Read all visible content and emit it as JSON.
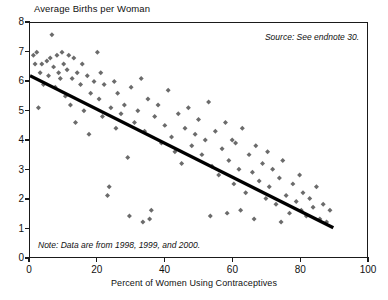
{
  "chart_data": {
    "type": "scatter",
    "title": "",
    "xlabel": "Percent of Women Using Contraceptives",
    "ylabel": "Average Births per Woman",
    "xlim": [
      0,
      100
    ],
    "ylim": [
      0,
      8
    ],
    "xticks": [
      0,
      20,
      40,
      60,
      80,
      100
    ],
    "yticks": [
      0,
      1,
      2,
      3,
      4,
      5,
      6,
      7,
      8
    ],
    "grid": false,
    "legend": null,
    "marker": "diamond",
    "marker_color": "#6b6b6b",
    "annotations": [
      {
        "name": "source",
        "text": "Source: See endnote 30.",
        "position": "top-right",
        "style": "italic"
      },
      {
        "name": "note",
        "text": "Note: Data are from 1998, 1999, and 2000.",
        "position": "bottom-left",
        "style": "italic"
      }
    ],
    "trendline": {
      "type": "linear",
      "color": "#000000",
      "x_start": 0,
      "y_start": 6.2,
      "x_end": 90,
      "y_end": 1.0
    },
    "points": [
      [
        1.0,
        6.9
      ],
      [
        1.5,
        6.6
      ],
      [
        2.0,
        7.0
      ],
      [
        2.5,
        5.1
      ],
      [
        3.0,
        6.3
      ],
      [
        3.5,
        6.6
      ],
      [
        4.0,
        5.9
      ],
      [
        5.0,
        6.7
      ],
      [
        5.5,
        6.2
      ],
      [
        6.0,
        6.8
      ],
      [
        6.5,
        7.6
      ],
      [
        7.0,
        6.5
      ],
      [
        7.5,
        5.8
      ],
      [
        8.0,
        6.9
      ],
      [
        8.5,
        6.3
      ],
      [
        9.0,
        6.1
      ],
      [
        9.5,
        7.0
      ],
      [
        10.0,
        6.6
      ],
      [
        10.5,
        5.5
      ],
      [
        11.0,
        6.4
      ],
      [
        11.5,
        6.9
      ],
      [
        12.0,
        5.2
      ],
      [
        12.5,
        6.1
      ],
      [
        13.0,
        6.8
      ],
      [
        13.5,
        4.6
      ],
      [
        14.0,
        6.3
      ],
      [
        15.0,
        5.9
      ],
      [
        15.5,
        6.6
      ],
      [
        16.0,
        5.0
      ],
      [
        17.0,
        6.2
      ],
      [
        17.5,
        4.2
      ],
      [
        18.0,
        5.6
      ],
      [
        19.0,
        6.0
      ],
      [
        20.0,
        7.0
      ],
      [
        20.5,
        5.4
      ],
      [
        21.0,
        6.3
      ],
      [
        21.5,
        4.8
      ],
      [
        22.0,
        5.9
      ],
      [
        23.0,
        2.1
      ],
      [
        23.5,
        2.4
      ],
      [
        24.0,
        5.1
      ],
      [
        25.0,
        6.0
      ],
      [
        25.5,
        4.4
      ],
      [
        26.0,
        5.6
      ],
      [
        27.0,
        4.9
      ],
      [
        28.0,
        5.2
      ],
      [
        29.0,
        3.4
      ],
      [
        30.0,
        5.8
      ],
      [
        31.0,
        4.6
      ],
      [
        32.0,
        5.0
      ],
      [
        33.0,
        6.1
      ],
      [
        34.0,
        4.3
      ],
      [
        35.0,
        5.4
      ],
      [
        36.0,
        1.6
      ],
      [
        37.0,
        4.8
      ],
      [
        38.0,
        5.2
      ],
      [
        39.0,
        3.9
      ],
      [
        40.0,
        4.5
      ],
      [
        41.0,
        5.7
      ],
      [
        42.0,
        4.1
      ],
      [
        43.0,
        3.6
      ],
      [
        44.0,
        4.9
      ],
      [
        45.0,
        3.2
      ],
      [
        46.0,
        4.4
      ],
      [
        47.0,
        5.1
      ],
      [
        48.0,
        3.8
      ],
      [
        49.0,
        4.2
      ],
      [
        50.0,
        4.7
      ],
      [
        51.0,
        3.5
      ],
      [
        52.0,
        4.0
      ],
      [
        53.0,
        5.3
      ],
      [
        54.0,
        3.1
      ],
      [
        55.0,
        4.3
      ],
      [
        56.0,
        2.8
      ],
      [
        57.0,
        3.7
      ],
      [
        58.0,
        4.6
      ],
      [
        59.0,
        3.3
      ],
      [
        60.0,
        4.0
      ],
      [
        60.5,
        2.5
      ],
      [
        61.0,
        3.9
      ],
      [
        62.0,
        3.0
      ],
      [
        63.0,
        4.4
      ],
      [
        64.0,
        2.2
      ],
      [
        65.0,
        3.5
      ],
      [
        66.0,
        2.9
      ],
      [
        67.0,
        3.8
      ],
      [
        68.0,
        2.6
      ],
      [
        69.0,
        3.2
      ],
      [
        70.0,
        2.0
      ],
      [
        70.5,
        3.6
      ],
      [
        71.0,
        2.4
      ],
      [
        72.0,
        3.0
      ],
      [
        73.0,
        1.8
      ],
      [
        74.0,
        2.7
      ],
      [
        75.0,
        3.3
      ],
      [
        76.0,
        2.1
      ],
      [
        77.0,
        1.5
      ],
      [
        78.0,
        2.5
      ],
      [
        79.0,
        1.9
      ],
      [
        80.0,
        2.8
      ],
      [
        80.5,
        1.6
      ],
      [
        81.0,
        2.2
      ],
      [
        82.0,
        1.4
      ],
      [
        83.0,
        2.0
      ],
      [
        84.0,
        1.7
      ],
      [
        85.0,
        2.4
      ],
      [
        86.0,
        1.3
      ],
      [
        87.0,
        1.8
      ],
      [
        88.0,
        1.2
      ],
      [
        89.0,
        1.6
      ],
      [
        53.5,
        1.4
      ],
      [
        58.5,
        1.5
      ],
      [
        62.5,
        1.6
      ],
      [
        66.5,
        1.3
      ],
      [
        74.5,
        1.2
      ],
      [
        29.5,
        1.4
      ],
      [
        33.5,
        1.2
      ],
      [
        35.5,
        1.3
      ]
    ]
  }
}
